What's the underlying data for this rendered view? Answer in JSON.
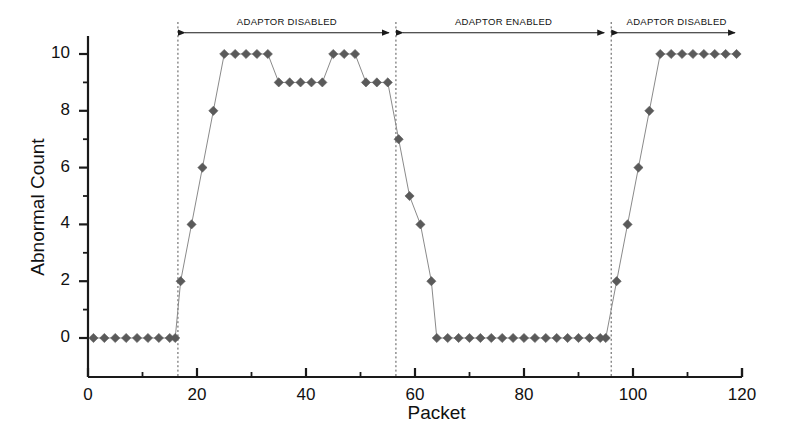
{
  "chart_data": {
    "type": "scatter",
    "title": "",
    "xlabel": "Packet",
    "ylabel": "Abnormal Count",
    "xlim": [
      0,
      120
    ],
    "ylim": [
      -0.6,
      11.2
    ],
    "xticks": [
      0,
      20,
      40,
      60,
      80,
      100,
      120
    ],
    "yticks": [
      0,
      2,
      4,
      6,
      8,
      10
    ],
    "xtick_labels": [
      "0",
      "20",
      "40",
      "60",
      "80",
      "100",
      "120"
    ],
    "ytick_labels": [
      "0",
      "2",
      "4",
      "6",
      "8",
      "10"
    ],
    "x_minor_tick_interval": 10,
    "y_minor_tick_interval": 1,
    "grid": false,
    "legend": null,
    "marker": "diamond",
    "marker_color": "#5a5a5a",
    "line_color": "#8a8a8a",
    "axis_color": "#1a1a1a",
    "series": [
      {
        "name": "Abnormal Count",
        "x": [
          1,
          3,
          5,
          7,
          9,
          11,
          13,
          15,
          16,
          17,
          19,
          21,
          23,
          25,
          27,
          29,
          31,
          33,
          35,
          37,
          39,
          41,
          43,
          45,
          47,
          49,
          51,
          53,
          55,
          57,
          59,
          61,
          63,
          64,
          66,
          68,
          70,
          72,
          74,
          76,
          78,
          80,
          82,
          84,
          86,
          88,
          90,
          92,
          94,
          95,
          97,
          99,
          101,
          103,
          105,
          107,
          109,
          111,
          113,
          115,
          117,
          119
        ],
        "y": [
          0,
          0,
          0,
          0,
          0,
          0,
          0,
          0,
          0,
          2,
          4,
          6,
          8,
          10,
          10,
          10,
          10,
          10,
          9,
          9,
          9,
          9,
          9,
          10,
          10,
          10,
          9,
          9,
          9,
          7,
          5,
          4,
          2,
          0,
          0,
          0,
          0,
          0,
          0,
          0,
          0,
          0,
          0,
          0,
          0,
          0,
          0,
          0,
          0,
          0,
          2,
          4,
          6,
          8,
          10,
          10,
          10,
          10,
          10,
          10,
          10,
          10
        ]
      }
    ],
    "dividers": [
      {
        "x": 16.5,
        "style": "dashed"
      },
      {
        "x": 56.5,
        "style": "dashed"
      },
      {
        "x": 96.0,
        "style": "dashed"
      }
    ],
    "annotations": [
      {
        "label": "ADAPTOR DISABLED",
        "x_start": 16.5,
        "x_end": 56.5,
        "y": 10.75,
        "arrow": "double"
      },
      {
        "label": "ADAPTOR ENABLED",
        "x_start": 56.5,
        "x_end": 96.0,
        "y": 10.75,
        "arrow": "double"
      },
      {
        "label": "ADAPTOR DISABLED",
        "x_start": 96.0,
        "x_end": 120.0,
        "y": 10.75,
        "arrow": "double"
      }
    ]
  },
  "axes": {
    "y_title": "Abnormal Count",
    "x_title": "Packet"
  }
}
